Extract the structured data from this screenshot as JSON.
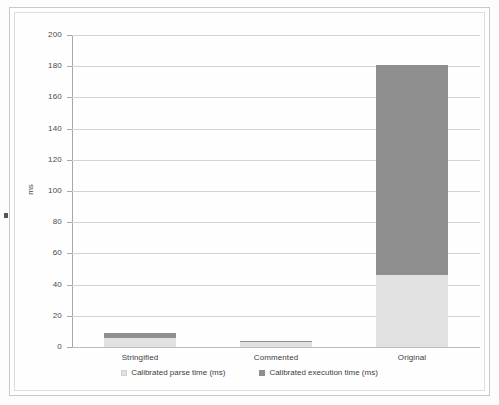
{
  "chart_data": {
    "type": "bar",
    "subtype": "stacked-column",
    "title": "",
    "xlabel": "",
    "ylabel": "ms",
    "ylim": [
      0,
      200
    ],
    "ytick_step": 20,
    "yticks": [
      "200",
      "180",
      "160",
      "140",
      "120",
      "100",
      "80",
      "60",
      "40",
      "20",
      "0"
    ],
    "grid": true,
    "legend_position": "bottom",
    "categories": [
      "Stringified",
      "Commented",
      "Original"
    ],
    "series": [
      {
        "name": "Calibrated parse time (ms)",
        "color": "#e2e2e2",
        "values": [
          6,
          3,
          46
        ]
      },
      {
        "name": "Calibrated execution time (ms)",
        "color": "#8f8f8f",
        "values": [
          3,
          1,
          135
        ]
      }
    ],
    "totals": [
      9,
      4,
      181
    ]
  },
  "legend": {
    "items": [
      {
        "label": "Calibrated parse time (ms)",
        "swatch": "legend-swatch-parse"
      },
      {
        "label": "Calibrated execution time (ms)",
        "swatch": "legend-swatch-exec"
      }
    ]
  },
  "axis": {
    "y_title": "ms"
  },
  "colors": {
    "parse": "#e2e2e2",
    "execution": "#8f8f8f",
    "gridline": "#d4d4d4",
    "axis": "#a8a8a8",
    "text": "#3d3d3d"
  }
}
